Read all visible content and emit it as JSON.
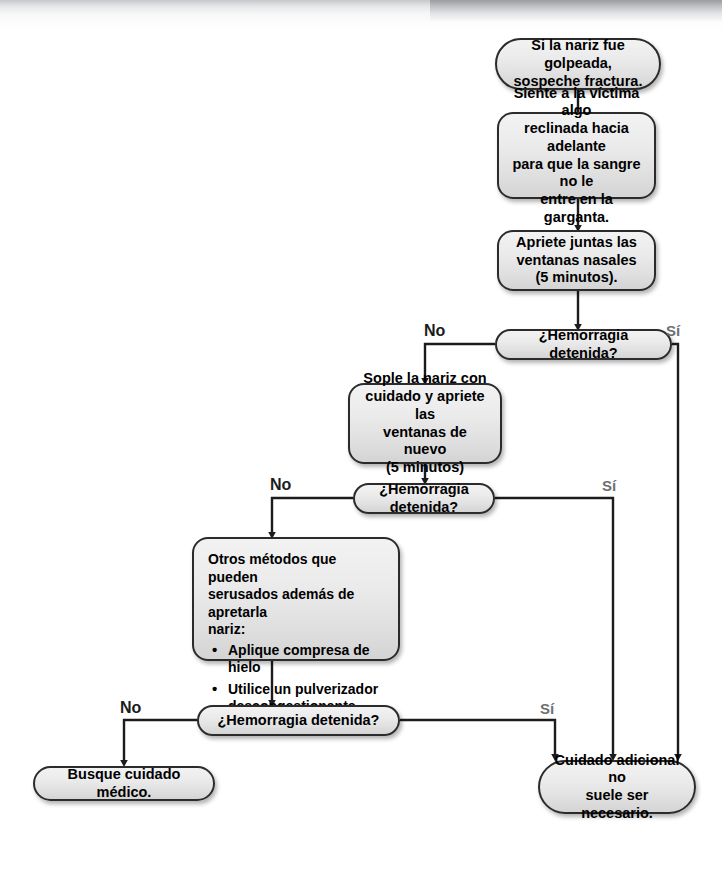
{
  "diagram": {
    "language": "es",
    "colors": {
      "node_fill_top": "#f2f2f2",
      "node_fill_bottom": "#d4d4d4",
      "node_border": "#2b2b2b",
      "connector": "#1c1c1c",
      "label_yes": "#6f7073",
      "label_no": "#1c1c1c",
      "background": "#ffffff"
    }
  },
  "nodes": {
    "start_note": {
      "type": "terminator",
      "lines": [
        "Si la nariz fue golpeada,",
        "sospeche fractura."
      ]
    },
    "step_sit_victim": {
      "type": "process",
      "lines": [
        "Siente a la víctima algo",
        "reclinada hacia adelante",
        "para que la sangre no le",
        "entre en la garganta."
      ]
    },
    "step_pinch_nostrils": {
      "type": "process",
      "lines": [
        "Apriete  juntas las",
        "ventanas nasales",
        "(5 minutos)."
      ]
    },
    "decision_1": {
      "type": "decision",
      "label": "¿Hemorragia detenida?"
    },
    "step_blow_nose": {
      "type": "process",
      "lines": [
        "Sople la nariz con",
        "cuidado y apriete las",
        "ventanas de nuevo",
        "(5 minutos)"
      ]
    },
    "decision_2": {
      "type": "decision",
      "label": "¿Hemorragia detenida?"
    },
    "step_other_methods": {
      "type": "list",
      "intro_lines": [
        "Otros métodos que pueden",
        "serusados además de apretarla",
        "nariz:"
      ],
      "bullet_char": "•",
      "bullets": [
        [
          "Aplique compresa de hielo"
        ],
        [
          "Utilice un pulverizador",
          "descongestionante"
        ]
      ]
    },
    "decision_3": {
      "type": "decision",
      "label": "¿Hemorragia detenida?"
    },
    "end_seek_care": {
      "type": "terminator",
      "lines": [
        "Busque cuidado médico."
      ]
    },
    "end_no_extra_care": {
      "type": "terminator",
      "lines": [
        "Cuidado adicional no",
        "suele ser necesario."
      ]
    }
  },
  "branch_labels": {
    "no_1": "No",
    "si_1": "Sí",
    "no_2": "No",
    "si_2": "Sí",
    "no_3": "No",
    "si_3": "Sí"
  }
}
